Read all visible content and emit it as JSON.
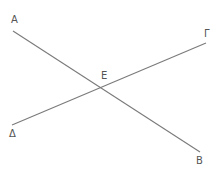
{
  "diagram": {
    "type": "geometry",
    "colors": {
      "line": "#7a7a7a",
      "label": "#555555",
      "background": "#ffffff"
    },
    "points": {
      "A": {
        "label": "A",
        "x": 13,
        "y": 31,
        "label_x": 11,
        "label_y": 23
      },
      "B": {
        "label": "B",
        "x": 200,
        "y": 152,
        "label_x": 196,
        "label_y": 164
      },
      "G": {
        "label": "Γ",
        "x": 206,
        "y": 43,
        "label_x": 204,
        "label_y": 37
      },
      "D": {
        "label": "Δ",
        "x": 12,
        "y": 125,
        "label_x": 9,
        "label_y": 137
      },
      "E": {
        "label": "E",
        "x": 106,
        "y": 86,
        "label_x": 101,
        "label_y": 79
      }
    },
    "segments": [
      {
        "name": "AB",
        "from": "A",
        "to": "B"
      },
      {
        "name": "ΓΔ",
        "from": "G",
        "to": "D"
      }
    ]
  }
}
